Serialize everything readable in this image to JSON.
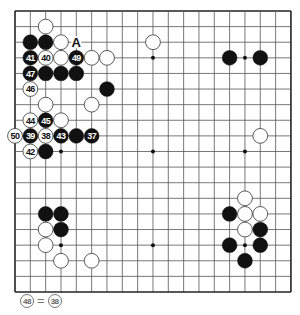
{
  "board": {
    "size": 19,
    "origin_x": 15,
    "origin_y": 11,
    "spacing_x": 15.33,
    "spacing_y": 15.61,
    "line_color": "#555555",
    "edge_color": "#222222",
    "star_points": [
      [
        3,
        3
      ],
      [
        3,
        9
      ],
      [
        3,
        15
      ],
      [
        9,
        3
      ],
      [
        9,
        9
      ],
      [
        9,
        15
      ],
      [
        15,
        3
      ],
      [
        15,
        9
      ],
      [
        15,
        15
      ]
    ],
    "black_color": "#111111",
    "white_fill": "#ffffff",
    "white_stroke": "#333333"
  },
  "stones": [
    {
      "color": "white",
      "col": 2,
      "row": 1,
      "label": ""
    },
    {
      "color": "black",
      "col": 1,
      "row": 2,
      "label": ""
    },
    {
      "color": "black",
      "col": 2,
      "row": 2,
      "label": ""
    },
    {
      "color": "white",
      "col": 3,
      "row": 2,
      "label": ""
    },
    {
      "color": "white",
      "col": 9,
      "row": 2,
      "label": ""
    },
    {
      "color": "black",
      "col": 1,
      "row": 3,
      "label": "41"
    },
    {
      "color": "white",
      "col": 2,
      "row": 3,
      "label": "40"
    },
    {
      "color": "white",
      "col": 3,
      "row": 3,
      "label": ""
    },
    {
      "color": "black",
      "col": 4,
      "row": 3,
      "label": "49"
    },
    {
      "color": "white",
      "col": 5,
      "row": 3,
      "label": ""
    },
    {
      "color": "white",
      "col": 6,
      "row": 3,
      "label": ""
    },
    {
      "color": "black",
      "col": 1,
      "row": 4,
      "label": "47"
    },
    {
      "color": "black",
      "col": 2,
      "row": 4,
      "label": ""
    },
    {
      "color": "black",
      "col": 3,
      "row": 4,
      "label": ""
    },
    {
      "color": "black",
      "col": 4,
      "row": 4,
      "label": ""
    },
    {
      "color": "white",
      "col": 1,
      "row": 5,
      "label": "46"
    },
    {
      "color": "black",
      "col": 6,
      "row": 5,
      "label": ""
    },
    {
      "color": "white",
      "col": 2,
      "row": 6,
      "label": ""
    },
    {
      "color": "white",
      "col": 5,
      "row": 6,
      "label": ""
    },
    {
      "color": "white",
      "col": 1,
      "row": 7,
      "label": "44"
    },
    {
      "color": "black",
      "col": 2,
      "row": 7,
      "label": "45"
    },
    {
      "color": "white",
      "col": 3,
      "row": 7,
      "label": ""
    },
    {
      "color": "white",
      "col": 0,
      "row": 8,
      "label": "50"
    },
    {
      "color": "black",
      "col": 1,
      "row": 8,
      "label": "39"
    },
    {
      "color": "white",
      "col": 2,
      "row": 8,
      "label": "38"
    },
    {
      "color": "black",
      "col": 3,
      "row": 8,
      "label": "43"
    },
    {
      "color": "black",
      "col": 4,
      "row": 8,
      "label": ""
    },
    {
      "color": "black",
      "col": 5,
      "row": 8,
      "label": "37"
    },
    {
      "color": "white",
      "col": 1,
      "row": 9,
      "label": "42"
    },
    {
      "color": "black",
      "col": 2,
      "row": 9,
      "label": ""
    },
    {
      "color": "black",
      "col": 14,
      "row": 3,
      "label": ""
    },
    {
      "color": "black",
      "col": 16,
      "row": 3,
      "label": ""
    },
    {
      "color": "white",
      "col": 16,
      "row": 8,
      "label": ""
    },
    {
      "color": "white",
      "col": 15,
      "row": 12,
      "label": ""
    },
    {
      "color": "black",
      "col": 14,
      "row": 13,
      "label": ""
    },
    {
      "color": "white",
      "col": 15,
      "row": 13,
      "label": ""
    },
    {
      "color": "white",
      "col": 16,
      "row": 13,
      "label": ""
    },
    {
      "color": "white",
      "col": 15,
      "row": 14,
      "label": ""
    },
    {
      "color": "black",
      "col": 16,
      "row": 14,
      "label": ""
    },
    {
      "color": "black",
      "col": 14,
      "row": 15,
      "label": ""
    },
    {
      "color": "black",
      "col": 16,
      "row": 15,
      "label": ""
    },
    {
      "color": "black",
      "col": 15,
      "row": 16,
      "label": ""
    },
    {
      "color": "black",
      "col": 2,
      "row": 13,
      "label": ""
    },
    {
      "color": "black",
      "col": 3,
      "row": 13,
      "label": ""
    },
    {
      "color": "white",
      "col": 2,
      "row": 14,
      "label": ""
    },
    {
      "color": "black",
      "col": 3,
      "row": 14,
      "label": ""
    },
    {
      "color": "white",
      "col": 2,
      "row": 15,
      "label": ""
    },
    {
      "color": "white",
      "col": 3,
      "row": 16,
      "label": ""
    },
    {
      "color": "white",
      "col": 5,
      "row": 16,
      "label": ""
    }
  ],
  "markers": [
    {
      "col": 4,
      "row": 2,
      "text": "A"
    }
  ],
  "caption": {
    "left_move": "48",
    "equals": "=",
    "right_move": "38"
  }
}
